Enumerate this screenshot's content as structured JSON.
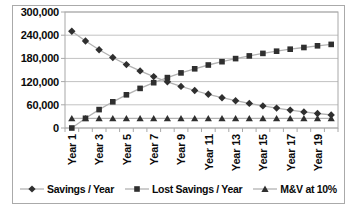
{
  "chart_data": {
    "type": "line",
    "title": "",
    "x_categories": [
      "Year 1",
      "Year 2",
      "Year 3",
      "Year 4",
      "Year 5",
      "Year 6",
      "Year 7",
      "Year 8",
      "Year 9",
      "Year 10",
      "Year 11",
      "Year 12",
      "Year 13",
      "Year 14",
      "Year 15",
      "Year 16",
      "Year 17",
      "Year 18",
      "Year 19",
      "Year 20"
    ],
    "x_shown_ticklabels": [
      "Year 1",
      "Year 3",
      "Year 5",
      "Year 7",
      "Year 9",
      "Year 11",
      "Year 13",
      "Year 15",
      "Year 17",
      "Year 19"
    ],
    "y_ticks": [
      0,
      60000,
      120000,
      180000,
      240000,
      300000
    ],
    "y_ticklabels": [
      "0",
      "60,000",
      "120,000",
      "180,000",
      "240,000",
      "300,000"
    ],
    "ylim": [
      0,
      300000
    ],
    "grid": "horizontal",
    "legend_position": "bottom",
    "series": [
      {
        "name": "Savings / Year",
        "marker": "diamond",
        "values": [
          250000,
          225000,
          202500,
          182250,
          164025,
          147623,
          132860,
          119574,
          107617,
          96855,
          87169,
          78452,
          70607,
          63546,
          57192,
          51473,
          46325,
          41693,
          37523,
          33771
        ]
      },
      {
        "name": "Lost Savings / Year",
        "marker": "square",
        "values": [
          0,
          25000,
          47500,
          67750,
          85975,
          102378,
          117140,
          130426,
          142383,
          153145,
          162831,
          171548,
          179393,
          186454,
          192808,
          198527,
          203675,
          208307,
          212477,
          216229
        ]
      },
      {
        "name": "M&V at 10%",
        "marker": "triangle",
        "values": [
          25000,
          25000,
          25000,
          25000,
          25000,
          25000,
          25000,
          25000,
          25000,
          25000,
          25000,
          25000,
          25000,
          25000,
          25000,
          25000,
          25000,
          25000,
          25000,
          25000
        ]
      }
    ],
    "colors": {
      "marker": "#2f2f2f",
      "series_line": "#b2b2b2",
      "gridline": "#c2c2c2",
      "axis": "#a8a8a8",
      "frame_border": "#aaaaaa",
      "text": "#0a0a0a",
      "background": "#ffffff"
    }
  }
}
